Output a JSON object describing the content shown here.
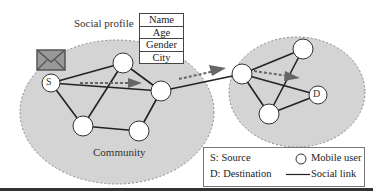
{
  "diagram": {
    "profile_label": "Social profile",
    "profile_fields": [
      "Name",
      "Age",
      "Gender",
      "City"
    ],
    "community_label": "Community",
    "source_node_label": "S",
    "destination_node_label": "D",
    "legend": {
      "source": "S: Source",
      "destination": "D: Destination",
      "mobile_user": "Mobile user",
      "social_link": "Social link"
    },
    "colors": {
      "community_fill": "#d4d4d4",
      "community_border": "#888888",
      "node_fill": "#ffffff",
      "link": "#222222",
      "arrow": "#666666",
      "envelope": "#666666"
    }
  }
}
